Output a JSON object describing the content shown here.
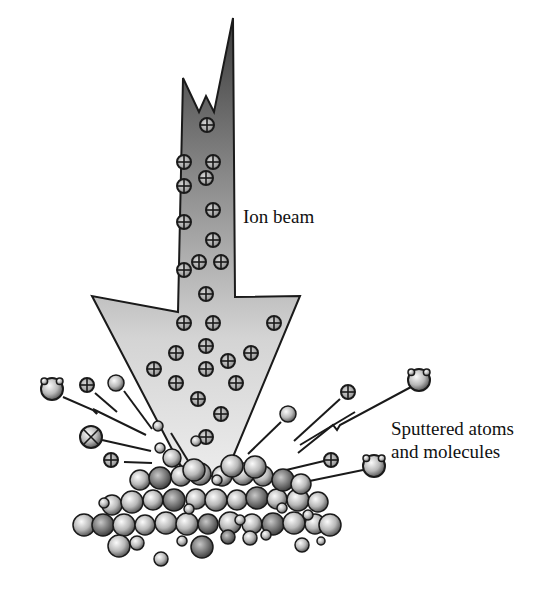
{
  "diagram": {
    "labels": {
      "ion_beam": "Ion beam",
      "sputtered_line1": "Sputtered atoms",
      "sputtered_line2": "and molecules"
    },
    "colors": {
      "outline": "#1a1a1a",
      "beam_dark": "#3c3c3c",
      "beam_light": "#e2e2e2",
      "atom_light": "#f4f4f4",
      "atom_dark": "#5a5a5a"
    },
    "ions_in_beam": [
      [
        207,
        125
      ],
      [
        184,
        162
      ],
      [
        213,
        162
      ],
      [
        184,
        186
      ],
      [
        206,
        178
      ],
      [
        213,
        210
      ],
      [
        184,
        222
      ],
      [
        213,
        240
      ],
      [
        184,
        270
      ],
      [
        199,
        262
      ],
      [
        221,
        262
      ],
      [
        206,
        294
      ],
      [
        184,
        323
      ],
      [
        213,
        323
      ],
      [
        274,
        323
      ],
      [
        176,
        353
      ],
      [
        206,
        346
      ],
      [
        251,
        353
      ],
      [
        154,
        369
      ],
      [
        228,
        361
      ],
      [
        176,
        383
      ],
      [
        206,
        369
      ],
      [
        236,
        383
      ],
      [
        198,
        399
      ],
      [
        221,
        414
      ],
      [
        206,
        437
      ]
    ],
    "sputtered_ions": [
      [
        87,
        385
      ],
      [
        348,
        392
      ],
      [
        111,
        460
      ],
      [
        331,
        460
      ]
    ],
    "sputtered_atoms": [
      [
        116,
        383
      ],
      [
        288,
        414
      ],
      [
        158,
        426
      ],
      [
        160,
        448
      ],
      [
        196,
        441
      ]
    ],
    "molecules": [
      [
        52,
        389
      ],
      [
        419,
        380
      ],
      [
        374,
        466
      ]
    ],
    "cross_atom": [
      91,
      437
    ]
  }
}
